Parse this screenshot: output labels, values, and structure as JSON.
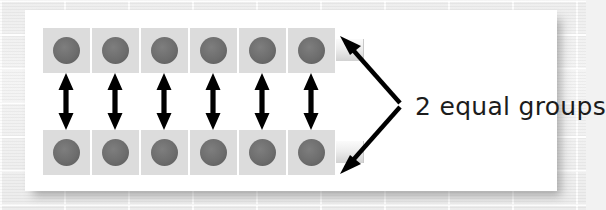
{
  "figure": {
    "label": "2 equal groups",
    "panel_background": "#ffffff",
    "page_background": "#f0f0f0",
    "cell_color": "#dcdcdc",
    "dot_color": "#6d6d6d",
    "arrow_color": "#000000",
    "label_color": "#1c1c1c",
    "rows": [
      {
        "name": "top-row",
        "counter_count": 6,
        "counters": [
          "dot",
          "dot",
          "dot",
          "dot",
          "dot",
          "dot"
        ]
      },
      {
        "name": "bottom-row",
        "counter_count": 6,
        "counters": [
          "dot",
          "dot",
          "dot",
          "dot",
          "dot",
          "dot"
        ]
      }
    ],
    "pairing_arrows": {
      "count": 6,
      "icon": "double-headed-vertical-arrow-icon"
    },
    "brace": {
      "icon": "double-headed-brace-arrow-icon",
      "points_to": [
        "top-row",
        "bottom-row"
      ]
    },
    "totals": {
      "groups": 2,
      "per_group": 6,
      "total_counters": 12
    }
  }
}
